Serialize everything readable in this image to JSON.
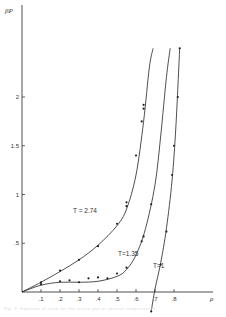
{
  "chart_data": {
    "type": "line",
    "title": "",
    "xlabel": "ρ",
    "ylabel": "βP",
    "xlim": [
      0,
      0.9
    ],
    "ylim": [
      0,
      2.6
    ],
    "grid": false,
    "x_ticks": [
      ".1",
      ".2",
      ".3",
      ".4",
      ".5",
      ".6",
      ".7",
      ".8"
    ],
    "y_ticks": [
      ".5",
      "1",
      "1.5",
      "2"
    ],
    "series": [
      {
        "name": "T = 2.74",
        "label": "T = 2.74",
        "points": [
          [
            0.1,
            0.1
          ],
          [
            0.2,
            0.22
          ],
          [
            0.3,
            0.33
          ],
          [
            0.4,
            0.47
          ],
          [
            0.5,
            0.7
          ],
          [
            0.55,
            0.88
          ],
          [
            0.55,
            0.92
          ],
          [
            0.6,
            1.4
          ],
          [
            0.63,
            1.75
          ],
          [
            0.64,
            1.88
          ],
          [
            0.64,
            1.92
          ]
        ],
        "curve": [
          [
            0,
            0
          ],
          [
            0.1,
            0.1
          ],
          [
            0.2,
            0.21
          ],
          [
            0.3,
            0.33
          ],
          [
            0.4,
            0.48
          ],
          [
            0.5,
            0.68
          ],
          [
            0.55,
            0.85
          ],
          [
            0.6,
            1.2
          ],
          [
            0.64,
            1.75
          ],
          [
            0.67,
            2.3
          ],
          [
            0.69,
            2.5
          ]
        ]
      },
      {
        "name": "T=1.35",
        "label": "T=1.35",
        "points": [
          [
            0.1,
            0.08
          ],
          [
            0.2,
            0.11
          ],
          [
            0.25,
            0.12
          ],
          [
            0.3,
            0.1
          ],
          [
            0.35,
            0.14
          ],
          [
            0.4,
            0.15
          ],
          [
            0.45,
            0.14
          ],
          [
            0.5,
            0.19
          ],
          [
            0.55,
            0.25
          ],
          [
            0.63,
            0.52
          ],
          [
            0.64,
            0.57
          ],
          [
            0.68,
            0.9
          ]
        ],
        "curve": [
          [
            0,
            0
          ],
          [
            0.1,
            0.07
          ],
          [
            0.2,
            0.1
          ],
          [
            0.3,
            0.1
          ],
          [
            0.4,
            0.11
          ],
          [
            0.5,
            0.16
          ],
          [
            0.55,
            0.23
          ],
          [
            0.6,
            0.38
          ],
          [
            0.65,
            0.65
          ],
          [
            0.7,
            1.1
          ],
          [
            0.73,
            1.6
          ],
          [
            0.76,
            2.2
          ],
          [
            0.78,
            2.5
          ]
        ]
      },
      {
        "name": "T=1",
        "label": "T=1",
        "points": [
          [
            0.68,
            -0.2
          ],
          [
            0.73,
            0.28
          ],
          [
            0.76,
            0.62
          ],
          [
            0.79,
            1.2
          ],
          [
            0.8,
            1.5
          ],
          [
            0.82,
            2.0
          ],
          [
            0.83,
            2.5
          ]
        ],
        "curve": [
          [
            0.68,
            -0.2
          ],
          [
            0.7,
            0.03
          ],
          [
            0.73,
            0.3
          ],
          [
            0.76,
            0.65
          ],
          [
            0.79,
            1.15
          ],
          [
            0.81,
            1.7
          ],
          [
            0.83,
            2.5
          ]
        ]
      }
    ],
    "annotations": [
      "T = 2.74",
      "T=1.35",
      "T=1"
    ]
  },
  "axes": {
    "y_label": "βP",
    "x_label": "ρ"
  },
  "caption": "Fig. 3. Equation of state for the lattice gas at several temperatures"
}
